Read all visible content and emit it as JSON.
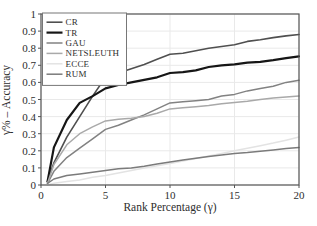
{
  "chart_data": {
    "type": "line",
    "title": "",
    "xlabel": "Rank Percentage (γ)",
    "ylabel": "γ% – Accuracy",
    "xlim": [
      0,
      20
    ],
    "ylim": [
      0,
      1
    ],
    "xticks": [
      0,
      5,
      10,
      15,
      20
    ],
    "yticks": [
      0,
      0.1,
      0.2,
      0.3,
      0.4,
      0.5,
      0.6,
      0.7,
      0.8,
      0.9,
      1
    ],
    "grid": true,
    "legend_position": "top-left",
    "axis_color": "#555555",
    "grid_color": "#e9e9e9",
    "text_color": "#2e2e2e",
    "x": [
      0.5,
      1,
      2,
      3,
      4,
      5,
      6,
      7,
      8,
      9,
      10,
      11,
      12,
      13,
      14,
      15,
      16,
      17,
      18,
      19,
      20
    ],
    "series": [
      {
        "name": "CR",
        "color": "#4f4f4f",
        "width": 1.6,
        "values": [
          0.02,
          0.13,
          0.28,
          0.4,
          0.52,
          0.63,
          0.655,
          0.68,
          0.705,
          0.735,
          0.765,
          0.77,
          0.785,
          0.8,
          0.81,
          0.82,
          0.84,
          0.85,
          0.862,
          0.872,
          0.88
        ]
      },
      {
        "name": "TR",
        "color": "#161616",
        "width": 2.2,
        "values": [
          0.02,
          0.22,
          0.38,
          0.48,
          0.52,
          0.565,
          0.585,
          0.6,
          0.615,
          0.63,
          0.655,
          0.66,
          0.67,
          0.69,
          0.7,
          0.705,
          0.715,
          0.72,
          0.73,
          0.742,
          0.752
        ]
      },
      {
        "name": "GAU",
        "color": "#828282",
        "width": 1.5,
        "values": [
          0.01,
          0.08,
          0.16,
          0.215,
          0.27,
          0.325,
          0.35,
          0.38,
          0.41,
          0.445,
          0.48,
          0.487,
          0.493,
          0.5,
          0.52,
          0.53,
          0.55,
          0.565,
          0.578,
          0.6,
          0.612
        ]
      },
      {
        "name": "NETSLEUTH",
        "color": "#a9a9a9",
        "width": 1.5,
        "values": [
          0.01,
          0.12,
          0.235,
          0.3,
          0.34,
          0.375,
          0.385,
          0.39,
          0.4,
          0.42,
          0.445,
          0.452,
          0.458,
          0.465,
          0.475,
          0.482,
          0.49,
          0.5,
          0.508,
          0.514,
          0.52
        ]
      },
      {
        "name": "ECCE",
        "color": "#e3e3e3",
        "width": 1.5,
        "values": [
          0.0,
          0.01,
          0.02,
          0.03,
          0.045,
          0.055,
          0.07,
          0.085,
          0.1,
          0.112,
          0.125,
          0.14,
          0.155,
          0.17,
          0.185,
          0.2,
          0.215,
          0.23,
          0.245,
          0.262,
          0.28
        ]
      },
      {
        "name": "RUM",
        "color": "#7b7b7b",
        "width": 1.5,
        "values": [
          0.01,
          0.035,
          0.055,
          0.065,
          0.075,
          0.085,
          0.095,
          0.1,
          0.11,
          0.122,
          0.135,
          0.146,
          0.156,
          0.166,
          0.175,
          0.185,
          0.19,
          0.197,
          0.205,
          0.214,
          0.22
        ]
      }
    ]
  }
}
